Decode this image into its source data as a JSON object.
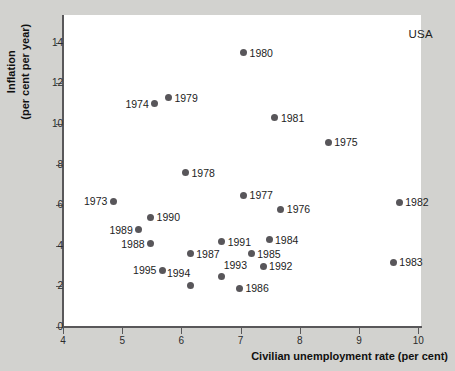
{
  "chart_data": {
    "type": "scatter",
    "title": "",
    "xlabel": "Civilian unemployment rate (per cent)",
    "ylabel_line1": "Inflation",
    "ylabel_line2": "(per cent per year)",
    "annotation": "USA",
    "xlim": [
      4,
      10.3
    ],
    "ylim": [
      0,
      15
    ],
    "xticks": [
      4,
      5,
      6,
      7,
      8,
      9,
      10
    ],
    "yticks": [
      0,
      2,
      4,
      6,
      8,
      10,
      12,
      14
    ],
    "xticklabels": [
      "4",
      "5",
      "6",
      "7",
      "8",
      "9",
      "10"
    ],
    "yticklabels": [
      "0",
      "2",
      "4",
      "6",
      "8",
      "10",
      "12",
      "14"
    ],
    "grid": false,
    "legend": "none",
    "marker_color": "#58565a",
    "points": [
      {
        "label": "1973",
        "x": 4.85,
        "y": 6.2,
        "pos": "left"
      },
      {
        "label": "1974",
        "x": 5.55,
        "y": 11.0,
        "pos": "left"
      },
      {
        "label": "1975",
        "x": 8.48,
        "y": 9.1,
        "pos": "right"
      },
      {
        "label": "1976",
        "x": 7.68,
        "y": 5.8,
        "pos": "right"
      },
      {
        "label": "1977",
        "x": 7.05,
        "y": 6.5,
        "pos": "right"
      },
      {
        "label": "1978",
        "x": 6.07,
        "y": 7.6,
        "pos": "right"
      },
      {
        "label": "1979",
        "x": 5.78,
        "y": 11.3,
        "pos": "right"
      },
      {
        "label": "1980",
        "x": 7.05,
        "y": 13.5,
        "pos": "right"
      },
      {
        "label": "1981",
        "x": 7.58,
        "y": 10.3,
        "pos": "right"
      },
      {
        "label": "1982",
        "x": 9.68,
        "y": 6.15,
        "pos": "right"
      },
      {
        "label": "1983",
        "x": 9.58,
        "y": 3.2,
        "pos": "right"
      },
      {
        "label": "1984",
        "x": 7.48,
        "y": 4.3,
        "pos": "right"
      },
      {
        "label": "1985",
        "x": 7.18,
        "y": 3.6,
        "pos": "right"
      },
      {
        "label": "1986",
        "x": 6.98,
        "y": 1.9,
        "pos": "right"
      },
      {
        "label": "1987",
        "x": 6.15,
        "y": 3.6,
        "pos": "right"
      },
      {
        "label": "1988",
        "x": 5.48,
        "y": 4.1,
        "pos": "left"
      },
      {
        "label": "1989",
        "x": 5.28,
        "y": 4.8,
        "pos": "left"
      },
      {
        "label": "1990",
        "x": 5.48,
        "y": 5.4,
        "pos": "right"
      },
      {
        "label": "1991",
        "x": 6.68,
        "y": 4.2,
        "pos": "right"
      },
      {
        "label": "1992",
        "x": 7.38,
        "y": 3.0,
        "pos": "right"
      },
      {
        "label": "1993",
        "x": 6.68,
        "y": 2.5,
        "pos": "above-right"
      },
      {
        "label": "1994",
        "x": 6.15,
        "y": 2.05,
        "pos": "above-left"
      },
      {
        "label": "1995",
        "x": 5.68,
        "y": 2.8,
        "pos": "left"
      }
    ]
  }
}
